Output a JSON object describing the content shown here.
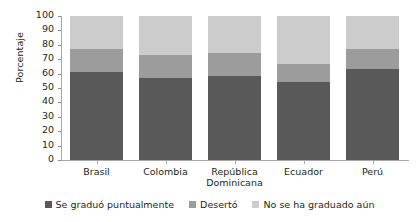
{
  "chart_data": {
    "type": "bar",
    "stacked": true,
    "title": "",
    "xlabel": "",
    "ylabel": "Porcentaje",
    "ylim": [
      0,
      100
    ],
    "yticks": [
      0,
      10,
      20,
      30,
      40,
      50,
      60,
      70,
      80,
      90,
      100
    ],
    "ytick_labels": [
      "0",
      "10",
      "20",
      "30",
      "40",
      "50",
      "60",
      "70",
      "80",
      "90",
      "100"
    ],
    "grid": false,
    "legend_position": "bottom",
    "categories": [
      "Brasil",
      "Colombia",
      "República Dominicana",
      "Ecuador",
      "Perú"
    ],
    "category_lines": [
      [
        "Brasil"
      ],
      [
        "Colombia"
      ],
      [
        "República",
        "Dominicana"
      ],
      [
        "Ecuador"
      ],
      [
        "Perú"
      ]
    ],
    "series": [
      {
        "name": "Se graduó puntualmente",
        "color": "#59595a",
        "values": [
          61,
          57,
          58,
          54,
          63
        ]
      },
      {
        "name": "Desertó",
        "color": "#9c9c9c",
        "values": [
          16,
          16,
          16,
          13,
          14
        ]
      },
      {
        "name": "No se ha graduado aún",
        "color": "#cccccc",
        "values": [
          23,
          27,
          26,
          33,
          23
        ]
      }
    ]
  },
  "axis": {
    "y_title": "Porcentaje"
  },
  "legend": {
    "items": [
      {
        "label": "Se graduó puntualmente",
        "color": "#59595a"
      },
      {
        "label": "Desertó",
        "color": "#9c9c9c"
      },
      {
        "label": "No se ha graduado aún",
        "color": "#cccccc"
      }
    ]
  },
  "colors": {
    "axis": "#a8a8a8",
    "text": "#231f20",
    "background": "#ffffff",
    "graduated_on_time": "#59595a",
    "dropped_out": "#9c9c9c",
    "not_yet_graduated": "#cccccc"
  }
}
